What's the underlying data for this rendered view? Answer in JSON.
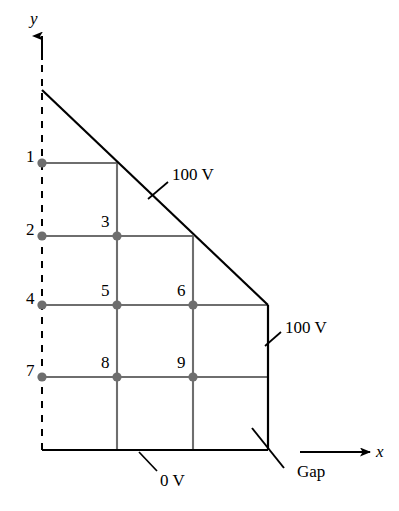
{
  "figure": {
    "background_color": "#ffffff",
    "line_color": "#000000",
    "mesh_color": "#6e6e6e",
    "node_fill_color": "#6e6e6e",
    "width": 399,
    "height": 511
  },
  "axes": {
    "y_label": "y",
    "x_label": "x",
    "y_axis_style": "dashed-with-arrow",
    "x_axis_style": "solid-with-arrow"
  },
  "nodes": [
    {
      "id": "1",
      "label": "1",
      "x": 42,
      "y": 163,
      "label_x": 26,
      "label_y": 148
    },
    {
      "id": "2",
      "label": "2",
      "x": 42,
      "y": 236,
      "label_x": 26,
      "label_y": 221
    },
    {
      "id": "3",
      "label": "3",
      "x": 117,
      "y": 236,
      "label_x": 101,
      "label_y": 213
    },
    {
      "id": "4",
      "label": "4",
      "x": 42,
      "y": 305,
      "label_x": 26,
      "label_y": 290
    },
    {
      "id": "5",
      "label": "5",
      "x": 117,
      "y": 305,
      "label_x": 101,
      "label_y": 282
    },
    {
      "id": "6",
      "label": "6",
      "x": 193,
      "y": 305,
      "label_x": 177,
      "label_y": 282
    },
    {
      "id": "7",
      "label": "7",
      "x": 42,
      "y": 377,
      "label_x": 26,
      "label_y": 362
    },
    {
      "id": "8",
      "label": "8",
      "x": 117,
      "y": 377,
      "label_x": 101,
      "label_y": 354
    },
    {
      "id": "9",
      "label": "9",
      "x": 193,
      "y": 377,
      "label_x": 177,
      "label_y": 354
    }
  ],
  "annotations": [
    {
      "id": "diagonal-potential",
      "text": "100 V",
      "x": 172,
      "y": 166,
      "leader_from": [
        168,
        183
      ],
      "leader_to": [
        148,
        199
      ]
    },
    {
      "id": "right-wall-potential",
      "text": "100 V",
      "x": 283,
      "y": 319,
      "leader_from": [
        280,
        333
      ],
      "leader_to": [
        264,
        346
      ]
    },
    {
      "id": "bottom-potential",
      "text": "0 V",
      "x": 160,
      "y": 477,
      "leader_from": [
        156,
        472
      ],
      "leader_to": [
        138,
        452
      ]
    },
    {
      "id": "gap-label",
      "text": "Gap",
      "x": 297,
      "y": 471
    }
  ],
  "boundary_conditions": {
    "diagonal": "100 V",
    "right_wall": "100 V",
    "bottom": "0 V",
    "gap_note": "Gap"
  },
  "geometry": {
    "left_boundary_x": 42,
    "right_boundary_x": 268,
    "bottom_boundary_y": 450,
    "diagonal_start": [
      42,
      90
    ],
    "diagonal_end": [
      268,
      305
    ],
    "y_axis_top": [
      42,
      36
    ],
    "x_arrow_start": [
      300,
      452
    ],
    "x_arrow_end": [
      372,
      452
    ],
    "grid_columns_x": [
      42,
      117,
      193,
      268
    ],
    "grid_rows_y": [
      163,
      236,
      305,
      377,
      450
    ]
  }
}
